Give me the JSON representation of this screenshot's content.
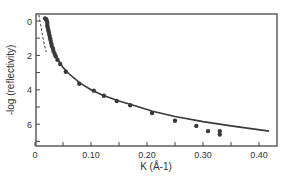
{
  "chart_data": {
    "type": "scatter",
    "title": "",
    "xlabel": "K (Å-1)",
    "ylabel": "-log (reflectivity)",
    "xlim": [
      0,
      0.432
    ],
    "ylim": [
      -0.4,
      7.3
    ],
    "y_inverted": true,
    "grid": false,
    "legend": null,
    "x_ticks": [
      0,
      0.05,
      0.1,
      0.15,
      0.2,
      0.25,
      0.3,
      0.35,
      0.4
    ],
    "x_tick_labels": [
      "0",
      "",
      "0.10",
      "",
      "0.20",
      "",
      "0.30",
      "",
      "0.40"
    ],
    "y_ticks": [
      0,
      1,
      2,
      3,
      4,
      5,
      6,
      7
    ],
    "y_tick_labels": [
      "0",
      "",
      "2",
      "",
      "4",
      "",
      "6",
      ""
    ],
    "series": [
      {
        "name": "measured",
        "style": "points",
        "color": "#3a3a3a",
        "points": [
          [
            0.018,
            -0.15
          ],
          [
            0.02,
            -0.1
          ],
          [
            0.021,
            0.0
          ],
          [
            0.022,
            0.1
          ],
          [
            0.022,
            0.25
          ],
          [
            0.023,
            0.4
          ],
          [
            0.024,
            0.55
          ],
          [
            0.025,
            0.7
          ],
          [
            0.026,
            0.85
          ],
          [
            0.027,
            1.0
          ],
          [
            0.028,
            1.15
          ],
          [
            0.029,
            1.3
          ],
          [
            0.03,
            1.45
          ],
          [
            0.032,
            1.6
          ],
          [
            0.033,
            1.75
          ],
          [
            0.035,
            1.9
          ],
          [
            0.037,
            2.05
          ],
          [
            0.04,
            2.25
          ],
          [
            0.045,
            2.5
          ],
          [
            0.055,
            2.95
          ],
          [
            0.079,
            3.65
          ],
          [
            0.105,
            4.05
          ],
          [
            0.123,
            4.35
          ],
          [
            0.146,
            4.65
          ],
          [
            0.17,
            4.9
          ],
          [
            0.209,
            5.35
          ],
          [
            0.25,
            5.8
          ],
          [
            0.288,
            6.1
          ],
          [
            0.309,
            6.4
          ],
          [
            0.33,
            6.4
          ],
          [
            0.33,
            6.6
          ]
        ]
      },
      {
        "name": "fit",
        "style": "solid",
        "color": "#3a3a3a",
        "points": [
          [
            0.02,
            0.3
          ],
          [
            0.025,
            0.9
          ],
          [
            0.03,
            1.45
          ],
          [
            0.035,
            1.9
          ],
          [
            0.04,
            2.2
          ],
          [
            0.05,
            2.7
          ],
          [
            0.06,
            3.05
          ],
          [
            0.08,
            3.6
          ],
          [
            0.1,
            4.0
          ],
          [
            0.12,
            4.3
          ],
          [
            0.15,
            4.65
          ],
          [
            0.18,
            4.95
          ],
          [
            0.21,
            5.25
          ],
          [
            0.25,
            5.55
          ],
          [
            0.3,
            5.85
          ],
          [
            0.35,
            6.1
          ],
          [
            0.418,
            6.4
          ]
        ]
      },
      {
        "name": "dashed",
        "style": "dashed",
        "color": "#3a3a3a",
        "points": [
          [
            0.007,
            -0.35
          ],
          [
            0.01,
            0.2
          ],
          [
            0.013,
            0.75
          ],
          [
            0.016,
            1.3
          ],
          [
            0.02,
            1.8
          ]
        ]
      }
    ]
  }
}
